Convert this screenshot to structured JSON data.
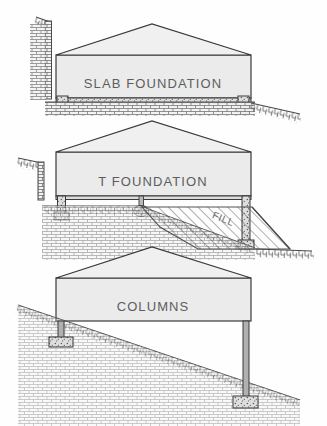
{
  "figure": {
    "background_color": "#fefefe",
    "line_color": "#3a3a3a",
    "building_fill_color": "#ebebeb",
    "label_color": "#5d5d5d",
    "ground_color": "#4a4a4a"
  },
  "diagrams": [
    {
      "id": "slab-foundation",
      "label": "SLAB  FOUNDATION",
      "order": 1,
      "foundation_type": "slab",
      "terrain": "cut with vertical retaining wall at left, gentle downslope to the right",
      "features": [
        "gable roof",
        "slab on grade",
        "perimeter footings",
        "aggregate bed"
      ]
    },
    {
      "id": "t-foundation",
      "label": "T FOUNDATION",
      "order": 2,
      "foundation_type": "t-footing",
      "terrain": "cut at left, engineered fill embankment at right",
      "features": [
        "gable roof",
        "perimeter T footings",
        "center pier footing",
        "fill wedge"
      ],
      "annotations": [
        {
          "id": "fill-label",
          "text": "FILL",
          "rotation_deg": 22
        }
      ]
    },
    {
      "id": "columns-foundation",
      "label": "COLUMNS",
      "order": 3,
      "foundation_type": "columns",
      "terrain": "uninterrupted natural downslope from left to right",
      "features": [
        "gable roof",
        "short column at uphill side",
        "tall column at downhill side",
        "isolated spread footings"
      ]
    }
  ]
}
